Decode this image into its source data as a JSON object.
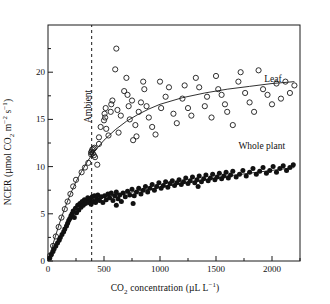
{
  "chart_data": {
    "type": "scatter",
    "title": "",
    "xlabel": "CO2 concentration (uL L-1)",
    "ylabel": "NCER (umol CO2 m-2 s-1)",
    "xlim": [
      0,
      2250
    ],
    "ylim": [
      0,
      25
    ],
    "xticks": [
      0,
      500,
      1000,
      1500,
      2000
    ],
    "xticks_minor": [
      250,
      750,
      1250,
      1750,
      2250
    ],
    "yticks": [
      0,
      5,
      10,
      15,
      20
    ],
    "yticks_minor": [
      2.5,
      7.5,
      12.5,
      17.5,
      22.5
    ],
    "grid": false,
    "legend_position": "in-plot-annotations",
    "annotations": [
      {
        "name": "leaf-label",
        "text": "Leaf",
        "x": 1930,
        "y": 19.2
      },
      {
        "name": "whole-plant-label",
        "text": "Whole plant",
        "x": 1700,
        "y": 12.1
      },
      {
        "name": "ambient-label",
        "text": "Ambient",
        "x": 390,
        "y": 17.0
      }
    ],
    "reference_line": {
      "name": "ambient-co2-line",
      "x": 390,
      "style": "dashed"
    },
    "series": [
      {
        "name": "Leaf",
        "marker": "open-circle",
        "points": [
          [
            20,
            0.6
          ],
          [
            45,
            1.6
          ],
          [
            70,
            2.6
          ],
          [
            95,
            3.6
          ],
          [
            120,
            4.6
          ],
          [
            150,
            5.5
          ],
          [
            175,
            6.3
          ],
          [
            200,
            7.1
          ],
          [
            225,
            7.9
          ],
          [
            250,
            8.6
          ],
          [
            300,
            9.4
          ],
          [
            330,
            9.9
          ],
          [
            360,
            10.4
          ],
          [
            385,
            11.3
          ],
          [
            385,
            11.5
          ],
          [
            390,
            11.6
          ],
          [
            395,
            11.8
          ],
          [
            400,
            11.4
          ],
          [
            405,
            11.9
          ],
          [
            410,
            11.2
          ],
          [
            415,
            12.0
          ],
          [
            420,
            11.0
          ],
          [
            440,
            10.2
          ],
          [
            455,
            13.1
          ],
          [
            455,
            12.4
          ],
          [
            470,
            14.2
          ],
          [
            500,
            14.9
          ],
          [
            505,
            15.6
          ],
          [
            510,
            15.2
          ],
          [
            515,
            16.2
          ],
          [
            520,
            14.0
          ],
          [
            540,
            13.3
          ],
          [
            560,
            15.8
          ],
          [
            565,
            16.6
          ],
          [
            575,
            17.0
          ],
          [
            600,
            20.3
          ],
          [
            610,
            22.5
          ],
          [
            620,
            16.0
          ],
          [
            630,
            13.6
          ],
          [
            650,
            15.4
          ],
          [
            680,
            18.0
          ],
          [
            700,
            19.4
          ],
          [
            710,
            17.6
          ],
          [
            720,
            16.4
          ],
          [
            730,
            15.0
          ],
          [
            750,
            17.0
          ],
          [
            760,
            12.8
          ],
          [
            780,
            14.4
          ],
          [
            790,
            13.2
          ],
          [
            810,
            15.8
          ],
          [
            830,
            16.8
          ],
          [
            850,
            19.0
          ],
          [
            860,
            18.2
          ],
          [
            880,
            16.4
          ],
          [
            900,
            15.2
          ],
          [
            930,
            14.2
          ],
          [
            960,
            13.4
          ],
          [
            1000,
            19.0
          ],
          [
            1010,
            16.2
          ],
          [
            1050,
            17.4
          ],
          [
            1080,
            18.4
          ],
          [
            1120,
            15.6
          ],
          [
            1150,
            14.6
          ],
          [
            1200,
            17.2
          ],
          [
            1220,
            18.6
          ],
          [
            1250,
            16.2
          ],
          [
            1280,
            15.4
          ],
          [
            1320,
            19.4
          ],
          [
            1350,
            18.4
          ],
          [
            1400,
            16.4
          ],
          [
            1420,
            17.4
          ],
          [
            1460,
            15.2
          ],
          [
            1500,
            19.6
          ],
          [
            1520,
            18.2
          ],
          [
            1550,
            17.6
          ],
          [
            1580,
            16.6
          ],
          [
            1600,
            15.8
          ],
          [
            1650,
            14.4
          ],
          [
            1700,
            19.0
          ],
          [
            1720,
            20.0
          ],
          [
            1760,
            17.8
          ],
          [
            1800,
            16.8
          ],
          [
            1840,
            15.8
          ],
          [
            1880,
            20.2
          ],
          [
            1920,
            18.2
          ],
          [
            1960,
            17.6
          ],
          [
            2000,
            16.6
          ],
          [
            2040,
            18.8
          ],
          [
            2080,
            17.2
          ],
          [
            2120,
            19.0
          ],
          [
            2160,
            17.8
          ],
          [
            2200,
            18.6
          ]
        ],
        "fit_curve": {
          "description": "saturating curve, asymptote near 19",
          "points": [
            [
              0,
              0.0
            ],
            [
              50,
              2.0
            ],
            [
              100,
              3.9
            ],
            [
              150,
              5.6
            ],
            [
              200,
              7.1
            ],
            [
              250,
              8.4
            ],
            [
              300,
              9.5
            ],
            [
              350,
              10.5
            ],
            [
              400,
              11.4
            ],
            [
              500,
              12.8
            ],
            [
              600,
              13.9
            ],
            [
              700,
              14.8
            ],
            [
              800,
              15.5
            ],
            [
              900,
              16.1
            ],
            [
              1000,
              16.6
            ],
            [
              1200,
              17.3
            ],
            [
              1400,
              17.8
            ],
            [
              1600,
              18.2
            ],
            [
              1800,
              18.5
            ],
            [
              2000,
              18.8
            ],
            [
              2200,
              19.0
            ]
          ]
        }
      },
      {
        "name": "Whole plant",
        "marker": "filled-circle",
        "points": [
          [
            15,
            0.3
          ],
          [
            30,
            0.7
          ],
          [
            45,
            1.0
          ],
          [
            55,
            1.3
          ],
          [
            70,
            1.6
          ],
          [
            85,
            1.9
          ],
          [
            100,
            2.2
          ],
          [
            110,
            2.5
          ],
          [
            125,
            2.8
          ],
          [
            140,
            3.1
          ],
          [
            150,
            3.4
          ],
          [
            165,
            3.7
          ],
          [
            175,
            4.0
          ],
          [
            185,
            4.3
          ],
          [
            195,
            4.5
          ],
          [
            205,
            4.8
          ],
          [
            215,
            5.0
          ],
          [
            225,
            5.3
          ],
          [
            235,
            4.6
          ],
          [
            245,
            5.6
          ],
          [
            255,
            5.1
          ],
          [
            265,
            5.9
          ],
          [
            275,
            5.4
          ],
          [
            285,
            6.1
          ],
          [
            295,
            5.7
          ],
          [
            305,
            6.3
          ],
          [
            315,
            5.9
          ],
          [
            325,
            6.5
          ],
          [
            335,
            6.1
          ],
          [
            345,
            6.4
          ],
          [
            355,
            6.7
          ],
          [
            365,
            6.2
          ],
          [
            375,
            6.6
          ],
          [
            385,
            6.0
          ],
          [
            395,
            6.8
          ],
          [
            405,
            6.3
          ],
          [
            415,
            6.9
          ],
          [
            425,
            6.2
          ],
          [
            435,
            6.6
          ],
          [
            445,
            7.0
          ],
          [
            460,
            6.4
          ],
          [
            475,
            6.8
          ],
          [
            490,
            6.2
          ],
          [
            505,
            6.9
          ],
          [
            520,
            6.5
          ],
          [
            535,
            7.1
          ],
          [
            550,
            6.7
          ],
          [
            565,
            7.2
          ],
          [
            580,
            6.4
          ],
          [
            595,
            6.9
          ],
          [
            610,
            7.3
          ],
          [
            625,
            6.6
          ],
          [
            640,
            7.0
          ],
          [
            655,
            6.3
          ],
          [
            670,
            7.2
          ],
          [
            690,
            6.8
          ],
          [
            710,
            7.4
          ],
          [
            730,
            7.0
          ],
          [
            750,
            7.6
          ],
          [
            770,
            6.9
          ],
          [
            790,
            7.3
          ],
          [
            810,
            7.7
          ],
          [
            830,
            7.1
          ],
          [
            850,
            7.5
          ],
          [
            870,
            7.9
          ],
          [
            890,
            7.3
          ],
          [
            910,
            7.7
          ],
          [
            930,
            8.1
          ],
          [
            950,
            7.5
          ],
          [
            970,
            7.9
          ],
          [
            990,
            8.3
          ],
          [
            1010,
            7.7
          ],
          [
            1030,
            8.0
          ],
          [
            1050,
            8.4
          ],
          [
            1070,
            7.8
          ],
          [
            1090,
            8.2
          ],
          [
            1110,
            8.5
          ],
          [
            1130,
            8.0
          ],
          [
            1150,
            8.3
          ],
          [
            1170,
            8.6
          ],
          [
            1190,
            8.1
          ],
          [
            1210,
            8.4
          ],
          [
            1230,
            8.8
          ],
          [
            1250,
            8.2
          ],
          [
            1270,
            8.5
          ],
          [
            1290,
            8.9
          ],
          [
            1310,
            8.3
          ],
          [
            1330,
            8.6
          ],
          [
            1350,
            9.0
          ],
          [
            1370,
            8.4
          ],
          [
            1390,
            8.7
          ],
          [
            1410,
            9.1
          ],
          [
            1430,
            8.5
          ],
          [
            1450,
            8.8
          ],
          [
            1470,
            9.2
          ],
          [
            1490,
            8.6
          ],
          [
            1510,
            8.9
          ],
          [
            1530,
            9.3
          ],
          [
            1550,
            8.7
          ],
          [
            1570,
            9.0
          ],
          [
            1590,
            9.4
          ],
          [
            1610,
            8.8
          ],
          [
            1630,
            9.1
          ],
          [
            1650,
            9.5
          ],
          [
            1680,
            8.9
          ],
          [
            1710,
            9.2
          ],
          [
            1740,
            9.6
          ],
          [
            1770,
            9.0
          ],
          [
            1800,
            9.4
          ],
          [
            1830,
            9.8
          ],
          [
            1860,
            9.2
          ],
          [
            1890,
            9.5
          ],
          [
            1920,
            9.9
          ],
          [
            1950,
            9.3
          ],
          [
            1980,
            9.6
          ],
          [
            2010,
            10.0
          ],
          [
            2040,
            9.4
          ],
          [
            2070,
            9.8
          ],
          [
            2100,
            10.1
          ],
          [
            2130,
            9.6
          ],
          [
            2160,
            9.9
          ],
          [
            2190,
            10.2
          ],
          [
            610,
            5.9
          ],
          [
            760,
            6.1
          ],
          [
            1340,
            7.9
          ]
        ],
        "fit_curve": {
          "description": "steep rise then near-linear plateau",
          "points": [
            [
              0,
              0.0
            ],
            [
              50,
              1.2
            ],
            [
              100,
              2.3
            ],
            [
              150,
              3.4
            ],
            [
              200,
              4.4
            ],
            [
              250,
              5.2
            ],
            [
              300,
              5.8
            ],
            [
              350,
              6.2
            ],
            [
              400,
              6.5
            ],
            [
              500,
              6.8
            ],
            [
              600,
              7.0
            ],
            [
              700,
              7.2
            ],
            [
              800,
              7.4
            ],
            [
              900,
              7.6
            ],
            [
              1000,
              7.8
            ],
            [
              1200,
              8.2
            ],
            [
              1400,
              8.6
            ],
            [
              1600,
              9.0
            ],
            [
              1800,
              9.3
            ],
            [
              2000,
              9.6
            ],
            [
              2200,
              9.9
            ]
          ]
        }
      }
    ]
  },
  "axes": {
    "x_title_parts": {
      "pre": "CO",
      "sub": "2",
      "mid": " concentration (µL L",
      "sup": "−1",
      "post": ")"
    },
    "y_title_parts": {
      "pre": "NCER (µmol CO",
      "sub": "2",
      "mid": " m",
      "sup1": "−2",
      "mid2": " s",
      "sup2": "−1",
      "post": ")"
    }
  }
}
